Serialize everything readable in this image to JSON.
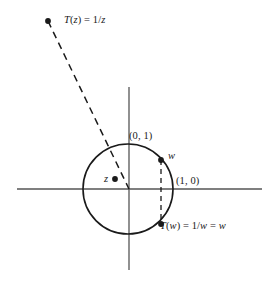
{
  "figure": {
    "type": "complex-plane-diagram",
    "background_color": "#ffffff",
    "stroke_color": "#1a1a1a",
    "axis_color": "#555555",
    "labels": {
      "t_of_z": "T(z) = 1/z",
      "z_point": "z",
      "w_point": "w",
      "point_0_1": "(0, 1)",
      "point_1_0": "(1, 0)",
      "t_of_w": "T(w) = 1/w = w"
    },
    "geometry": {
      "origin": {
        "x": 129,
        "y": 189
      },
      "unit_circle": {
        "cx": 128,
        "cy": 189,
        "r": 45
      },
      "x_axis": {
        "x1": 17,
        "y1": 189,
        "x2": 262,
        "y2": 189
      },
      "y_axis": {
        "x1": 129,
        "y1": 87,
        "x2": 129,
        "y2": 270
      },
      "points": {
        "t_of_z": {
          "x": 48,
          "y": 21
        },
        "z": {
          "x": 115,
          "y": 179
        },
        "w": {
          "x": 161,
          "y": 160
        },
        "t_of_w": {
          "x": 161,
          "y": 224
        }
      },
      "dashed_ray": {
        "x1": 48,
        "y1": 21,
        "x2": 129,
        "y2": 189
      },
      "dashed_chord": {
        "x1": 161,
        "y1": 160,
        "x2": 161,
        "y2": 224
      }
    }
  }
}
